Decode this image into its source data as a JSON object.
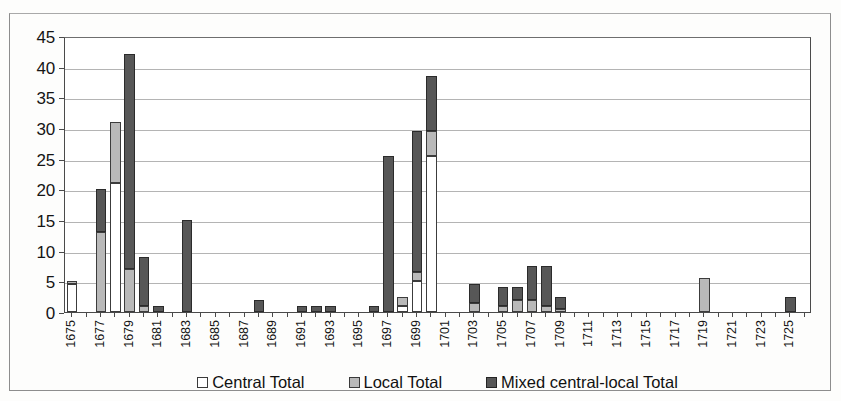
{
  "chart_data": {
    "type": "bar",
    "subtype": "stacked-column",
    "title": "",
    "xlabel": "",
    "ylabel": "",
    "ylim": [
      0,
      45
    ],
    "ytick_step": 5,
    "yticks": [
      "0",
      "5",
      "10",
      "15",
      "20",
      "25",
      "30",
      "35",
      "40",
      "45"
    ],
    "grid": true,
    "legend_position": "bottom",
    "xtick_step": 2,
    "xticks": [
      "1675",
      "1677",
      "1679",
      "1681",
      "1683",
      "1685",
      "1687",
      "1689",
      "1691",
      "1693",
      "1695",
      "1697",
      "1699",
      "1701",
      "1703",
      "1705",
      "1707",
      "1709",
      "1711",
      "1713",
      "1715",
      "1717",
      "1719",
      "1721",
      "1723",
      "1725"
    ],
    "categories": [
      "1675",
      "1676",
      "1677",
      "1678",
      "1679",
      "1680",
      "1681",
      "1682",
      "1683",
      "1684",
      "1685",
      "1686",
      "1687",
      "1688",
      "1689",
      "1690",
      "1691",
      "1692",
      "1693",
      "1694",
      "1695",
      "1696",
      "1697",
      "1698",
      "1699",
      "1700",
      "1701",
      "1702",
      "1703",
      "1704",
      "1705",
      "1706",
      "1707",
      "1708",
      "1709",
      "1710",
      "1711",
      "1712",
      "1713",
      "1714",
      "1715",
      "1716",
      "1717",
      "1718",
      "1719",
      "1720",
      "1721",
      "1722",
      "1723",
      "1724",
      "1725",
      "1726"
    ],
    "series": [
      {
        "name": "Central Total",
        "color": "#ffffff",
        "values": [
          4.5,
          0,
          0,
          21,
          0,
          0,
          0,
          0,
          0,
          0,
          0,
          0,
          0,
          0,
          0,
          0,
          0,
          0,
          0,
          0,
          0,
          0,
          0,
          1,
          5,
          25.5,
          0,
          0,
          0,
          0,
          0,
          0,
          0,
          0,
          0,
          0,
          0,
          0,
          0,
          0,
          0,
          0,
          0,
          0,
          0,
          0,
          0,
          0,
          0,
          0,
          0,
          0
        ]
      },
      {
        "name": "Local Total",
        "color": "#b9b9b9",
        "values": [
          0.5,
          0,
          13,
          10,
          7,
          1,
          0,
          0,
          0,
          0,
          0,
          0,
          0,
          0,
          0,
          0,
          0,
          0,
          0,
          0,
          0,
          0,
          0,
          1.5,
          1.5,
          4,
          0,
          0,
          1.5,
          0,
          1,
          2,
          2,
          1,
          0.5,
          0,
          0,
          0,
          0,
          0,
          0,
          0,
          0,
          0,
          5.5,
          0,
          0,
          0,
          0,
          0,
          0,
          0
        ]
      },
      {
        "name": "Mixed central-local Total",
        "color": "#575757",
        "values": [
          0,
          0,
          7,
          0,
          35,
          8,
          1,
          0,
          15,
          0,
          0,
          0,
          0,
          2,
          0,
          0,
          1,
          1,
          1,
          0,
          0,
          1,
          25.5,
          0,
          23,
          9,
          0,
          0,
          3,
          0,
          3,
          2,
          5.5,
          6.5,
          2,
          0,
          0,
          0,
          0,
          0,
          0,
          0,
          0,
          0,
          0,
          0,
          0,
          0,
          0,
          0,
          2.5,
          0
        ]
      }
    ],
    "totals": [
      5,
      0,
      20,
      31,
      42,
      9,
      1,
      0,
      15,
      0,
      0,
      0,
      0,
      2,
      0,
      0,
      1,
      1,
      1,
      0,
      0,
      1,
      25.5,
      2.5,
      29.5,
      38.5,
      0,
      0,
      4.5,
      0,
      4,
      4,
      7.5,
      7.5,
      2.5,
      0,
      0,
      0,
      0,
      0,
      0,
      0,
      0,
      0,
      5.5,
      0,
      0,
      0,
      0,
      0,
      2.5,
      0
    ]
  },
  "legend": {
    "items": [
      {
        "label": "Central Total",
        "swatch": "central"
      },
      {
        "label": "Local Total",
        "swatch": "local"
      },
      {
        "label": "Mixed central-local Total",
        "swatch": "mixed"
      }
    ]
  }
}
